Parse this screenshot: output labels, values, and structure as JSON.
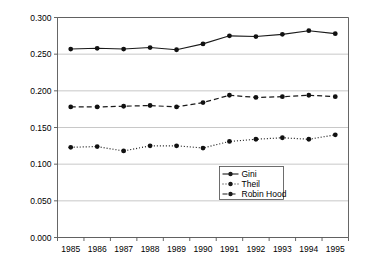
{
  "chart_data": {
    "type": "line",
    "title": "",
    "xlabel": "",
    "ylabel": "",
    "categories": [
      "1985",
      "1986",
      "1987",
      "1988",
      "1989",
      "1990",
      "1991",
      "1992",
      "1993",
      "1994",
      "1995"
    ],
    "x": [
      1985,
      1986,
      1987,
      1988,
      1989,
      1990,
      1991,
      1992,
      1993,
      1994,
      1995
    ],
    "ylim": [
      0.0,
      0.3
    ],
    "yticks": [
      0.0,
      0.05,
      0.1,
      0.15,
      0.2,
      0.25,
      0.3
    ],
    "ytick_labels": [
      "0.000",
      "0.050",
      "0.100",
      "0.150",
      "0.200",
      "0.250",
      "0.300"
    ],
    "grid": true,
    "grid_axis": "y",
    "legend_position": "lower right inside",
    "series": [
      {
        "name": "Gini",
        "line_style": "solid",
        "marker": "circle",
        "color": "#1a1a1a",
        "values": [
          0.257,
          0.258,
          0.257,
          0.259,
          0.256,
          0.264,
          0.275,
          0.274,
          0.277,
          0.282,
          0.278
        ]
      },
      {
        "name": "Theil",
        "line_style": "dotted",
        "marker": "circle",
        "color": "#1a1a1a",
        "values": [
          0.123,
          0.124,
          0.118,
          0.125,
          0.125,
          0.122,
          0.131,
          0.134,
          0.136,
          0.134,
          0.14
        ]
      },
      {
        "name": "Robin Hood",
        "line_style": "dashed",
        "marker": "circle",
        "color": "#1a1a1a",
        "values": [
          0.178,
          0.178,
          0.179,
          0.18,
          0.178,
          0.184,
          0.194,
          0.191,
          0.192,
          0.194,
          0.192
        ]
      }
    ]
  },
  "legend": {
    "items": [
      {
        "label": "Gini",
        "style": "solid"
      },
      {
        "label": "Theil",
        "style": "dotted"
      },
      {
        "label": "Robin Hood",
        "style": "dashed"
      }
    ]
  },
  "colors": {
    "background": "#ffffff",
    "grid": "#b0b0b0",
    "axis": "#555555",
    "series": "#1a1a1a",
    "text": "#000000"
  }
}
